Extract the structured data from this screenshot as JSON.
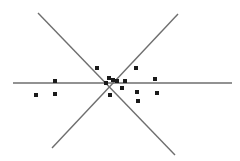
{
  "figure": {
    "width": 240,
    "height": 161,
    "background": "#ffffff"
  },
  "chart_data": {
    "type": "scatter",
    "title": "",
    "subtitle": "",
    "xlabel": "",
    "ylabel": "",
    "xlim": [
      0,
      240
    ],
    "ylim": [
      161,
      0
    ],
    "grid": false,
    "legend": null,
    "axes_visible": false,
    "tick_labels_x": [],
    "tick_labels_y": [],
    "annotations": [],
    "point_style": {
      "marker": "square",
      "size": 4,
      "color": "#1a1a1a"
    },
    "line_style": {
      "color": "#6e6e6e",
      "width": 1.4
    },
    "intersection": {
      "x": 106,
      "y": 83
    },
    "series": [
      {
        "name": "points",
        "marker": "square",
        "color": "#1a1a1a",
        "points": [
          {
            "x": 36,
            "y": 95
          },
          {
            "x": 55,
            "y": 94
          },
          {
            "x": 55,
            "y": 81
          },
          {
            "x": 97,
            "y": 68
          },
          {
            "x": 109,
            "y": 78
          },
          {
            "x": 113,
            "y": 80
          },
          {
            "x": 117,
            "y": 81
          },
          {
            "x": 110,
            "y": 95
          },
          {
            "x": 125,
            "y": 81
          },
          {
            "x": 136,
            "y": 68
          },
          {
            "x": 137,
            "y": 92
          },
          {
            "x": 138,
            "y": 101
          },
          {
            "x": 155,
            "y": 79
          },
          {
            "x": 157,
            "y": 93
          },
          {
            "x": 122,
            "y": 88
          },
          {
            "x": 106,
            "y": 83
          }
        ]
      }
    ],
    "lines": [
      {
        "name": "horizontal-line",
        "x1": 13,
        "y1": 83,
        "x2": 232,
        "y2": 83,
        "color": "#6e6e6e"
      },
      {
        "name": "diagonal-down-right-line",
        "x1": 38,
        "y1": 13,
        "x2": 175,
        "y2": 155,
        "color": "#6e6e6e"
      },
      {
        "name": "diagonal-up-right-line",
        "x1": 52,
        "y1": 148,
        "x2": 178,
        "y2": 14,
        "color": "#6e6e6e"
      }
    ]
  }
}
